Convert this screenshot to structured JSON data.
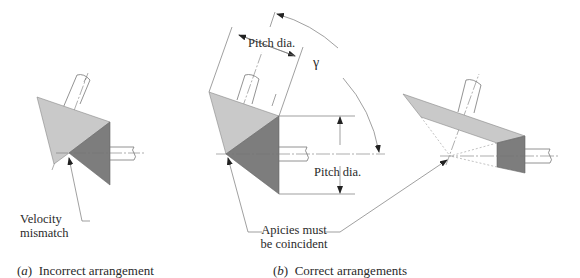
{
  "figure": {
    "panels": [
      {
        "id": "a",
        "caption_letter": "a",
        "caption_text": "Incorrect arrangement",
        "annotations": {
          "velocity_mismatch_line1": "Velocity",
          "velocity_mismatch_line2": "mismatch"
        }
      },
      {
        "id": "b",
        "caption_letter": "b",
        "caption_text": "Correct arrangements",
        "annotations": {
          "pitch_dia_top": "Pitch dia.",
          "pitch_dia_right": "Pitch dia.",
          "shaft_angle": "γ",
          "apicies_line1": "Apicies must",
          "apicies_line2": "be coincident"
        }
      }
    ],
    "colors": {
      "light_gear": "#c8c8c8",
      "dark_gear": "#7a7a7a",
      "line": "#6e6e6e",
      "text": "#2a2a2a"
    }
  }
}
